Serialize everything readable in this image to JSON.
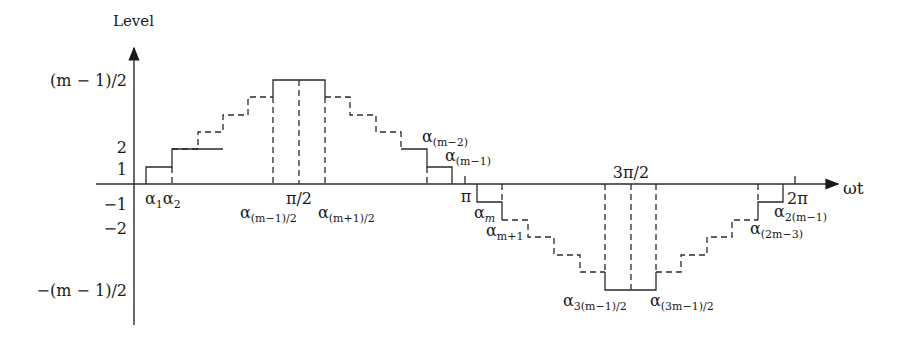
{
  "diagram": {
    "type": "multilevel staircase waveform",
    "y_axis_label": "Level",
    "x_axis_label": "ωt",
    "y_ticks": {
      "top": "(m − 1)/2",
      "two": "2",
      "one": "1",
      "neg_one": "−1",
      "neg_two": "−2",
      "bottom": "−(m − 1)/2"
    },
    "x_marks": {
      "half_pi": "π/2",
      "pi": "π",
      "three_half_pi": "3π/2",
      "two_pi": "2π"
    },
    "switching_angles": {
      "a1": {
        "base": "α",
        "sub": "1"
      },
      "a2": {
        "base": "α",
        "sub": "2"
      },
      "a_mid_left": {
        "base": "α",
        "sub": "(m−1)/2"
      },
      "a_mid_right": {
        "base": "α",
        "sub": "(m+1)/2"
      },
      "a_m_minus_2": {
        "base": "α",
        "sub": "(m−2)"
      },
      "a_m_minus_1": {
        "base": "α",
        "sub": "(m−1)"
      },
      "a_m": {
        "base": "α",
        "sub": "m"
      },
      "a_m_plus_1": {
        "base": "α",
        "sub": "m+1"
      },
      "a_3mid_left": {
        "base": "α",
        "sub": "3(m−1)/2"
      },
      "a_3mid_right": {
        "base": "α",
        "sub": "(3m−1)/2"
      },
      "a_2m_minus_3": {
        "base": "α",
        "sub": "(2m−3)"
      },
      "a_2m_minus_1": {
        "base": "α",
        "sub": "2(m−1)"
      }
    },
    "line_color": "#2a2a2a"
  }
}
